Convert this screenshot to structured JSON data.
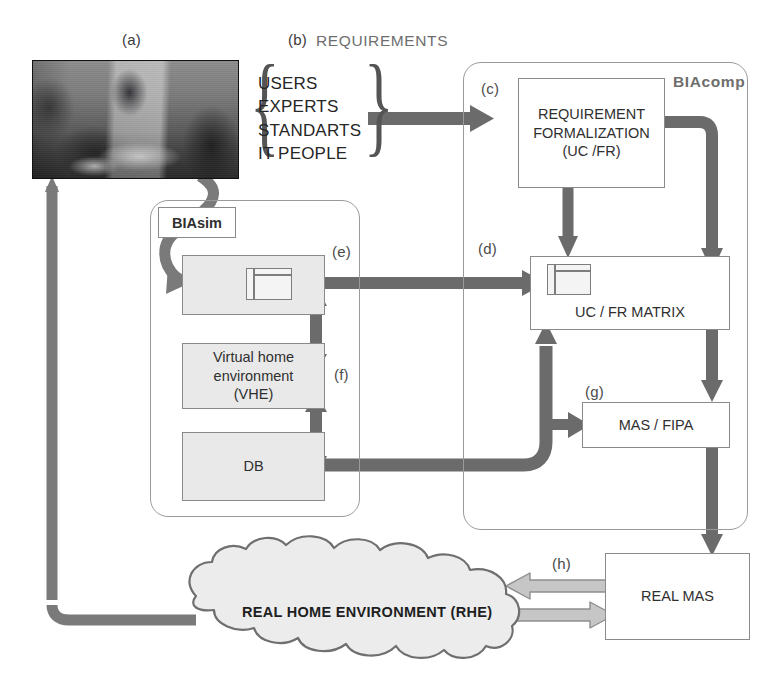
{
  "diagram": {
    "colors": {
      "arrow_dark": "#6b6b6b",
      "arrow_light": "#b9b9b9",
      "box_shade": "#e9e9e9",
      "border": "#8a8a8a",
      "group_border": "#9a9a9a",
      "label_gray": "#6e6e6e",
      "text": "#2f2f2f"
    },
    "labels": {
      "a": "(a)",
      "b": "(b)",
      "c": "(c)",
      "d": "(d)",
      "e": "(e)",
      "f": "(f)",
      "g": "(g)",
      "h": "(h)"
    },
    "headers": {
      "requirements": "REQUIREMENTS"
    },
    "photo": {
      "caption": "(a)",
      "alt": "meeting-room-photo"
    },
    "requirements": {
      "items": [
        "USERS",
        "EXPERTS",
        "STANDARTS",
        "IT PEOPLE"
      ],
      "text_block": "USERS\nEXPERTS\nSTANDARTS\nIT PEOPLE"
    },
    "groups": {
      "biasim": "BIAsim",
      "biacomp": "BIAcomp"
    },
    "boxes": {
      "requirement_formalization": "REQUIREMENT\nFORMALIZATION\n(UC /FR)",
      "requirement_formalization_lines": [
        "REQUIREMENT",
        "FORMALIZATION",
        "(UC /FR)"
      ],
      "uc_fr_matrix": "UC / FR MATRIX",
      "mas_fipa": "MAS / FIPA",
      "virtual_home_environment": "Virtual home\nenvironment\n(VHE)",
      "virtual_home_environment_lines": [
        "Virtual home",
        "environment",
        "(VHE)"
      ],
      "db": "DB",
      "real_mas": "REAL   MAS",
      "simulator": ""
    },
    "cloud": {
      "label": "REAL HOME ENVIRONMENT (RHE)"
    },
    "icons": {
      "window_e": "window-icon",
      "window_d": "window-icon"
    }
  }
}
